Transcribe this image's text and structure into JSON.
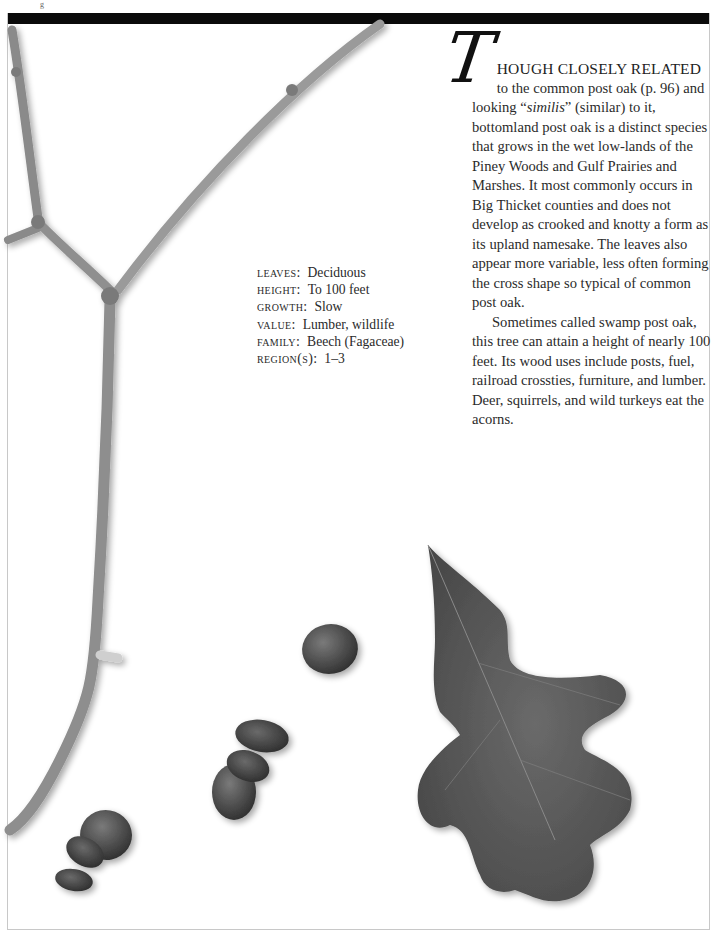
{
  "page": {
    "top_fragment": "g"
  },
  "article": {
    "drop_cap": "T",
    "lead_caps": "HOUGH CLOSELY RELATED",
    "paragraph1_a": "to the common post oak (p. 96) and looking “",
    "paragraph1_italic": "similis",
    "paragraph1_b": "” (similar) to it, bottomland post oak is a distinct species that grows in the wet low-lands of the Piney Woods and Gulf Prairies and Marshes. It most commonly occurs in Big Thicket counties and does not develop as crooked and knotty a form as its upland namesake. The leaves also appear more variable, less often forming the cross shape so typical of common post oak.",
    "paragraph2": "Sometimes called swamp post oak, this tree can attain a height of nearly 100 feet. Its wood uses include posts, fuel, railroad crossties, furniture, and lumber. Deer, squirrels, and wild turkeys eat the acorns."
  },
  "facts": [
    {
      "label": "LEAVES:",
      "value": "Deciduous"
    },
    {
      "label": "HEIGHT:",
      "value": "To 100 feet"
    },
    {
      "label": "GROWTH:",
      "value": "Slow"
    },
    {
      "label": "VALUE:",
      "value": "Lumber,  wildlife"
    },
    {
      "label": "FAMILY:",
      "value": "Beech (Fagaceae)"
    },
    {
      "label": "REGION(S):",
      "value": "1–3"
    }
  ],
  "images": {
    "twig": "bottomland-post-oak-twig",
    "acorns": "bottomland-post-oak-acorns",
    "leaf": "bottomland-post-oak-leaf"
  },
  "colors": {
    "top_bar": "#0a0a0a",
    "text": "#2b2b2b",
    "frame": "#c8c8c8"
  }
}
